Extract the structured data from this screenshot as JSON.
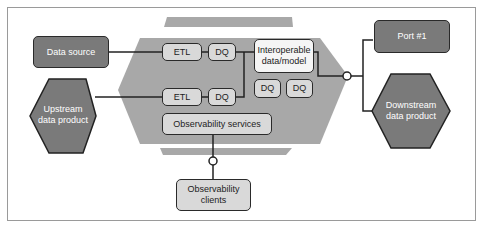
{
  "diagram": {
    "nodes": {
      "data_source": "Data source",
      "upstream": "Upstream\ndata product",
      "etl_1": "ETL",
      "dq_1": "DQ",
      "etl_2": "ETL",
      "dq_2": "DQ",
      "interop": "Interoperable\ndata/model",
      "dq_3": "DQ",
      "dq_4": "DQ",
      "observability_services": "Observability services",
      "observability_clients": "Observability\nclients",
      "port": "Port #1",
      "downstream": "Downstream\ndata product"
    },
    "colors": {
      "dark_fill": "#7a7a7a",
      "light_fill": "#d9d9d9",
      "hexagon_fill": "#a8a8a8",
      "band_fill": "#a8a8a8",
      "stroke": "#2a2a2a"
    }
  }
}
